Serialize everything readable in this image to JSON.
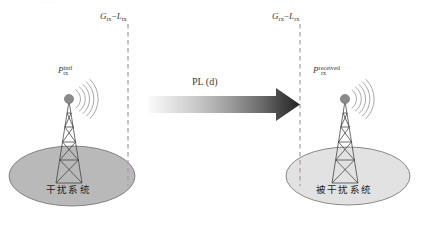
{
  "figure": {
    "type": "schematic-diagram",
    "topic": "interference-link-budget",
    "background_color": "#ffffff",
    "partial_top_text": "· · · · · · · · · · · · ·"
  },
  "labels": {
    "tx_gain_loss": {
      "base": "G",
      "sub": "tx",
      "op": "−",
      "base2": "L",
      "sub2": "tx",
      "full": "Gtx−Ltx"
    },
    "rx_gain_loss": {
      "base": "G",
      "sub": "rx",
      "op": "−",
      "base2": "L",
      "sub2": "rx",
      "full": "Grx−Lrx"
    },
    "tx_power": {
      "base": "P",
      "sub": "tx",
      "sup": "intf",
      "full": "Ptx^intf"
    },
    "rx_power": {
      "base": "P",
      "sub": "rx",
      "sup": "received",
      "full": "Prx^received"
    },
    "path_loss": "PL (d)",
    "left_system": "干扰系统",
    "right_system": "被干扰系统"
  },
  "colors": {
    "dashed_line": "#a99aa8",
    "left_ground_fill": "#b9b9b9",
    "left_ground_stroke": "#6e6e6e",
    "right_ground_fill": "#e2e2e2",
    "right_ground_stroke": "#6e6e6e",
    "tower_stroke": "#3c3c3c",
    "antenna_dot": "#8a8a8a",
    "wave_stroke": "#9a9a9a",
    "arrow_light": "#f2f2f2",
    "arrow_dark": "#2b2b2b",
    "text": "#3a3a3a"
  },
  "elements": {
    "left_tower": {
      "name": "interfering-transmitter-tower"
    },
    "right_tower": {
      "name": "victim-receiver-tower"
    },
    "arrow": {
      "name": "path-loss-arrow",
      "direction": "left-to-right"
    },
    "left_dashed": {
      "name": "tx-reference-plane"
    },
    "right_dashed": {
      "name": "rx-reference-plane"
    }
  }
}
